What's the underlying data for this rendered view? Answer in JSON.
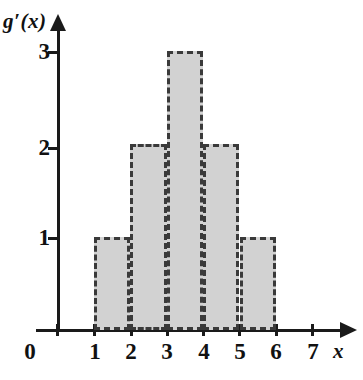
{
  "chart_data": {
    "type": "bar",
    "title": "",
    "subtitle": "",
    "xlabel": "x",
    "ylabel": "g'(x)",
    "ylabel_display": "g′(x)",
    "categories": [
      "[1,2]",
      "[2,3]",
      "[3,4]",
      "[4,5]",
      "[5,6]"
    ],
    "values": [
      1,
      2,
      3,
      2,
      1
    ],
    "bars": [
      {
        "x_start": 1,
        "x_end": 2,
        "height": 1
      },
      {
        "x_start": 2,
        "x_end": 3,
        "height": 2
      },
      {
        "x_start": 3,
        "x_end": 4,
        "height": 3
      },
      {
        "x_start": 4,
        "x_end": 5,
        "height": 2
      },
      {
        "x_start": 5,
        "x_end": 6,
        "height": 1
      }
    ],
    "xlim": [
      0,
      7
    ],
    "ylim": [
      0,
      3
    ],
    "x_ticks": [
      "0",
      "1",
      "2",
      "3",
      "4",
      "5",
      "6",
      "7"
    ],
    "y_ticks": [
      "3",
      "2",
      "1"
    ],
    "origin_label": "0",
    "grid": false,
    "legend": null,
    "bar_fill_color": "#d2d2d2",
    "bar_edge_color": "#3a3a3a",
    "bar_edge_style": "dashed",
    "axis_color": "#1a1a1a",
    "background_color": "#ffffff"
  }
}
